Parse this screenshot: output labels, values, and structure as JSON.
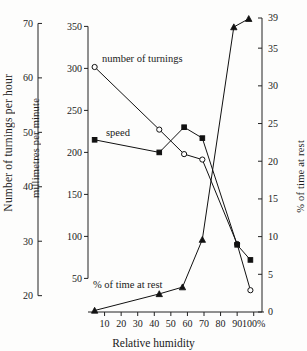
{
  "chart_data": {
    "type": "line",
    "title": "",
    "xlabel": "Relative humidity",
    "x_ticks": [
      "10",
      "20",
      "30",
      "40",
      "50",
      "60",
      "70",
      "80",
      "90",
      "100%"
    ],
    "x_tick_values": [
      10,
      20,
      30,
      40,
      50,
      60,
      70,
      80,
      90,
      100
    ],
    "xlim": [
      0,
      105
    ],
    "grid": false,
    "legend": "inline-annotations",
    "axes": [
      {
        "id": "left",
        "label": "Number of turnings per hour",
        "ticks": [
          "20",
          "30",
          "40",
          "50",
          "60",
          "70"
        ],
        "tick_values": [
          20,
          30,
          40,
          50,
          60,
          70
        ],
        "lim": [
          17,
          71
        ]
      },
      {
        "id": "middle",
        "label": "millimetres per minute",
        "ticks": [
          "50",
          "100",
          "150",
          "200",
          "250",
          "300",
          "350"
        ],
        "tick_values": [
          50,
          100,
          150,
          200,
          250,
          300,
          350
        ],
        "lim": [
          10,
          360
        ]
      },
      {
        "id": "right",
        "label": "% of time at rest",
        "ticks": [
          "0",
          "5",
          "10",
          "15",
          "20",
          "25",
          "30",
          "35",
          "39"
        ],
        "tick_values": [
          0,
          5,
          10,
          15,
          20,
          25,
          30,
          35,
          39
        ],
        "lim": [
          0,
          39
        ]
      }
    ],
    "series": [
      {
        "name": "number of turnings",
        "axis": "left",
        "marker": "open-circle",
        "annotation": "number of turnings",
        "x": [
          4,
          43,
          58,
          69,
          90,
          98
        ],
        "values": [
          62.0,
          50.5,
          46.0,
          45.0,
          29.5,
          21.0
        ]
      },
      {
        "name": "speed",
        "axis": "middle",
        "marker": "filled-square",
        "annotation": "speed",
        "x": [
          4,
          43,
          58,
          69,
          90,
          98
        ],
        "values": [
          215,
          200,
          230,
          217,
          90,
          72
        ]
      },
      {
        "name": "% of time at rest",
        "axis": "right",
        "marker": "triangle",
        "annotation": "% of time at rest",
        "x": [
          4,
          43,
          57,
          69,
          88,
          97
        ],
        "values": [
          0.2,
          2.4,
          3.3,
          9.6,
          37.8,
          38.9
        ]
      }
    ],
    "annotations": [
      {
        "text": "number of turnings",
        "x_px": 102,
        "y_px": 62
      },
      {
        "text": "speed",
        "x_px": 106,
        "y_px": 136
      },
      {
        "text": "% of time at rest",
        "x_px": 93,
        "y_px": 288
      }
    ]
  },
  "labels": {
    "ylabel_left": "Number of turnings per hour",
    "ylabel_mid": "millimetres per minute",
    "ylabel_right": "% of time at rest",
    "xlabel": "Relative humidity",
    "ann_turnings": "number of turnings",
    "ann_speed": "speed",
    "ann_rest": "% of time at rest"
  },
  "ticks": {
    "left": [
      "70",
      "60",
      "50",
      "40",
      "30",
      "20"
    ],
    "mid": [
      "350",
      "300",
      "250",
      "200",
      "150",
      "100",
      "50"
    ],
    "right": [
      "39",
      "35",
      "30",
      "25",
      "20",
      "15",
      "10",
      "5",
      "0"
    ],
    "x": [
      "10",
      "20",
      "30",
      "40",
      "50",
      "60",
      "70",
      "80",
      "90",
      "100%"
    ]
  },
  "colors": {
    "background": "#fdfdfc",
    "ink": "#1a1a1a",
    "line": "#111111"
  }
}
